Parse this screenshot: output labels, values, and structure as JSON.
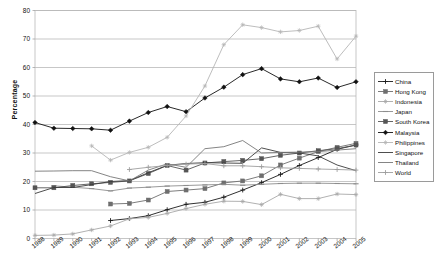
{
  "chart_data": {
    "type": "line",
    "title": "",
    "xlabel": "",
    "ylabel": "Percentage",
    "ylim": [
      0,
      80
    ],
    "ytick_step": 10,
    "grid": true,
    "legend_position": "right",
    "x": [
      "1988",
      "1989",
      "1990",
      "1991",
      "1992",
      "1993",
      "1994",
      "1995",
      "1996",
      "1997",
      "1998",
      "1999",
      "2000",
      "2001",
      "2002",
      "2003",
      "2004",
      "2005"
    ],
    "yticks": [
      "0",
      "10",
      "20",
      "30",
      "40",
      "50",
      "60",
      "70",
      "80"
    ],
    "series": [
      {
        "name": "China",
        "color": "#1a1a1a",
        "marker": "plus",
        "values": [
          null,
          null,
          null,
          null,
          6.3,
          7.0,
          8.0,
          10.1,
          12.0,
          12.7,
          14.5,
          17.0,
          19.6,
          22.5,
          25.6,
          28.4,
          31.3,
          32.8
        ]
      },
      {
        "name": "Hong Kong",
        "color": "#6e6e6e",
        "marker": "square",
        "values": [
          null,
          null,
          null,
          null,
          12.1,
          12.3,
          13.5,
          16.5,
          17.0,
          17.5,
          19.5,
          20.2,
          22.0,
          25.8,
          28.2,
          30.5,
          32.0,
          33.4
        ]
      },
      {
        "name": "Indonesia",
        "color": "#a8a8a8",
        "marker": "star",
        "values": [
          1.1,
          1.2,
          1.6,
          3.0,
          4.4,
          6.9,
          7.4,
          8.8,
          10.5,
          12.0,
          13.1,
          13.0,
          11.9,
          15.5,
          14.0,
          14.0,
          15.6,
          15.4
        ]
      },
      {
        "name": "Japan",
        "color": "#8d8d8d",
        "marker": "dash",
        "values": [
          null,
          18.5,
          18.0,
          17.5,
          16.7,
          17.7,
          18.0,
          18.4,
          18.6,
          18.8,
          19.0,
          18.7,
          19.0,
          19.3,
          19.4,
          19.4,
          19.3,
          19.2
        ]
      },
      {
        "name": "South Korea",
        "color": "#555555",
        "marker": "square",
        "values": [
          17.8,
          17.8,
          18.6,
          19.2,
          19.7,
          20.2,
          22.8,
          25.6,
          24.0,
          26.5,
          27.0,
          27.4,
          28.0,
          29.2,
          30.0,
          30.8,
          31.5,
          32.8
        ]
      },
      {
        "name": "Malaysia",
        "color": "#111111",
        "marker": "diamond",
        "values": [
          40.7,
          38.7,
          38.6,
          38.5,
          38.0,
          41.2,
          44.2,
          46.3,
          44.5,
          49.3,
          53.1,
          57.5,
          59.6,
          56.0,
          55.0,
          56.3,
          53.0,
          55.0
        ]
      },
      {
        "name": "Philippines",
        "color": "#b5b5b5",
        "marker": "star",
        "values": [
          null,
          null,
          null,
          32.5,
          27.5,
          30.2,
          32.0,
          35.5,
          43.0,
          53.5,
          68.0,
          75.0,
          74.0,
          72.5,
          73.0,
          74.5,
          63.0,
          71.0
        ]
      },
      {
        "name": "Singapore",
        "color": "#3a3a3a",
        "marker": "line",
        "values": [
          15.8,
          17.9,
          17.9,
          18.9,
          20.0,
          20.3,
          23.1,
          25.7,
          26.3,
          26.6,
          26.5,
          26.4,
          31.8,
          30.2,
          30.0,
          29.0,
          25.8,
          23.8
        ]
      },
      {
        "name": "Thailand",
        "color": "#777777",
        "marker": "line",
        "values": [
          23.6,
          23.7,
          23.8,
          23.8,
          21.7,
          20.2,
          24.0,
          26.2,
          25.0,
          31.5,
          32.2,
          34.4,
          30.0,
          30.2,
          30.3,
          30.5,
          31.0,
          31.5
        ]
      },
      {
        "name": "World",
        "color": "#9e9e9e",
        "marker": "plus",
        "values": [
          null,
          null,
          null,
          null,
          null,
          24.2,
          25.0,
          25.6,
          26.1,
          26.3,
          25.5,
          25.5,
          25.2,
          24.8,
          24.6,
          24.4,
          24.2,
          24.0
        ]
      }
    ]
  },
  "axis": {
    "ylabel": "Percentage"
  }
}
